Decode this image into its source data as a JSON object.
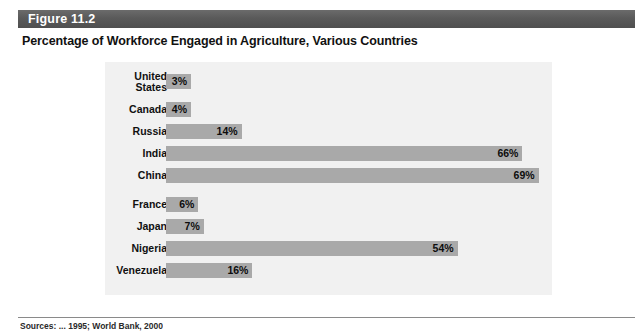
{
  "figure": {
    "number_label": "Figure 11.2",
    "title": "Percentage of Workforce Engaged in Agriculture, Various Countries",
    "source_note": "Sources: ... 1995; World Bank, 2000"
  },
  "colors": {
    "header_bar": "#5a5a5a",
    "panel_background": "#f1f1f1",
    "bar_fill": "#a9a9a9",
    "text": "#101010",
    "page_background": "#ffffff"
  },
  "chart_data": {
    "type": "bar",
    "orientation": "horizontal",
    "title": "Percentage of Workforce Engaged in Agriculture, Various Countries",
    "xlabel": "",
    "ylabel": "",
    "xlim": [
      0,
      80
    ],
    "grid": false,
    "legend": null,
    "value_suffix": "%",
    "categories": [
      "United States",
      "Canada",
      "Russia",
      "India",
      "China",
      "France",
      "Japan",
      "Nigeria",
      "Venezuela"
    ],
    "values": [
      3,
      4,
      14,
      66,
      69,
      6,
      7,
      54,
      16
    ],
    "data_labels": [
      "3%",
      "4%",
      "14%",
      "66%",
      "69%",
      "6%",
      "7%",
      "54%",
      "16%"
    ],
    "rows": [
      {
        "label": "United States",
        "label_lines": "United\nStates",
        "value": 3,
        "data_label": "3%",
        "two_line": true
      },
      {
        "label": "Canada",
        "label_lines": "Canada",
        "value": 4,
        "data_label": "4%",
        "two_line": false
      },
      {
        "label": "Russia",
        "label_lines": "Russia",
        "value": 14,
        "data_label": "14%",
        "two_line": false
      },
      {
        "label": "India",
        "label_lines": "India",
        "value": 66,
        "data_label": "66%",
        "two_line": false
      },
      {
        "label": "China",
        "label_lines": "China",
        "value": 69,
        "data_label": "69%",
        "two_line": false
      },
      {
        "label": "France",
        "label_lines": "France",
        "value": 6,
        "data_label": "6%",
        "two_line": false
      },
      {
        "label": "Japan",
        "label_lines": "Japan",
        "value": 7,
        "data_label": "7%",
        "two_line": false
      },
      {
        "label": "Nigeria",
        "label_lines": "Nigeria",
        "value": 54,
        "data_label": "54%",
        "two_line": false
      },
      {
        "label": "Venezuela",
        "label_lines": "Venezuela",
        "value": 16,
        "data_label": "16%",
        "two_line": false
      }
    ]
  },
  "layout": {
    "row_tops": [
      12,
      40,
      62,
      84,
      106,
      135,
      157,
      179,
      201
    ],
    "px_per_percent": 5.4,
    "bar_min_width": 25,
    "bar_height": 15
  }
}
